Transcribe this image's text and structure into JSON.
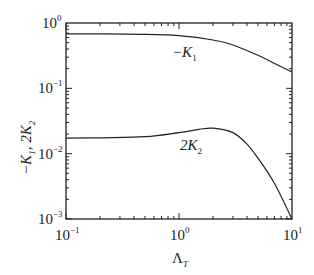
{
  "chart_data": {
    "type": "line",
    "title": "",
    "xlabel": "Λ_T",
    "ylabel": "−K_1, 2K_2",
    "xscale": "log",
    "yscale": "log",
    "xlim": [
      0.1,
      10
    ],
    "ylim": [
      0.001,
      1
    ],
    "x_ticks": [
      "10^-1",
      "10^0",
      "10^1"
    ],
    "y_ticks": [
      "10^-3",
      "10^-2",
      "10^-1",
      "10^0"
    ],
    "grid": false,
    "legend": "none (inline curve labels)",
    "series": [
      {
        "name": "−K_1",
        "x": [
          0.1,
          0.2,
          0.5,
          1.0,
          2.0,
          3.0,
          5.0,
          7.0,
          10.0
        ],
        "y": [
          0.68,
          0.68,
          0.67,
          0.64,
          0.55,
          0.46,
          0.32,
          0.24,
          0.178
        ]
      },
      {
        "name": "2K_2",
        "x": [
          0.1,
          0.2,
          0.5,
          1.0,
          1.5,
          2.0,
          3.0,
          4.0,
          5.0,
          7.0,
          10.0
        ],
        "y": [
          0.0173,
          0.0175,
          0.0182,
          0.021,
          0.0235,
          0.0245,
          0.021,
          0.014,
          0.0085,
          0.0035,
          0.001
        ]
      }
    ],
    "annotations": [
      {
        "text": "−K_1",
        "x": 1.1,
        "y": 0.42
      },
      {
        "text": "2K_2",
        "x": 1.3,
        "y": 0.013
      }
    ]
  },
  "labels": {
    "x_axis_main": "Λ",
    "x_axis_sub": "T",
    "y_axis_part1": "−K",
    "y_axis_sub1": "1",
    "y_axis_part2": ", 2K",
    "y_axis_sub2": "2",
    "curve1_main": "−K",
    "curve1_sub": "1",
    "curve2_main": "2K",
    "curve2_sub": "2",
    "tick_base": "10",
    "xtick_exps": [
      "−1",
      "0",
      "1"
    ],
    "ytick_exps": [
      "0",
      "−1",
      "−2",
      "−3"
    ]
  }
}
